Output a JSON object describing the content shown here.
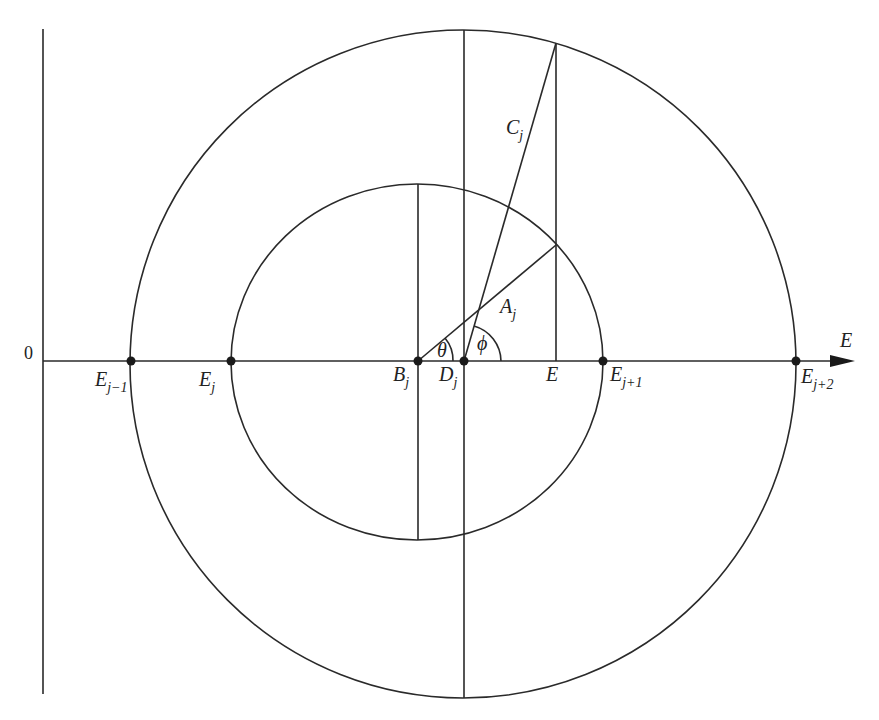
{
  "diagram": {
    "type": "geometric construction",
    "axis": {
      "horizontal_label": "E",
      "origin_label": "0"
    },
    "points": {
      "E_jm1": {
        "base": "E",
        "sub": "j−1"
      },
      "E_j": {
        "base": "E",
        "sub": "j"
      },
      "B_j": {
        "base": "B",
        "sub": "j"
      },
      "D_j": {
        "base": "D",
        "sub": "j"
      },
      "E": {
        "base": "E",
        "sub": ""
      },
      "E_jp1": {
        "base": "E",
        "sub": "j+1"
      },
      "E_jp2": {
        "base": "E",
        "sub": "j+2"
      }
    },
    "segments": {
      "A_j": {
        "base": "A",
        "sub": "j"
      },
      "C_j": {
        "base": "C",
        "sub": "j"
      }
    },
    "angles": {
      "theta": "θ",
      "phi": "ϕ"
    },
    "colors": {
      "line": "#2a2a2a",
      "background": "#ffffff"
    }
  }
}
